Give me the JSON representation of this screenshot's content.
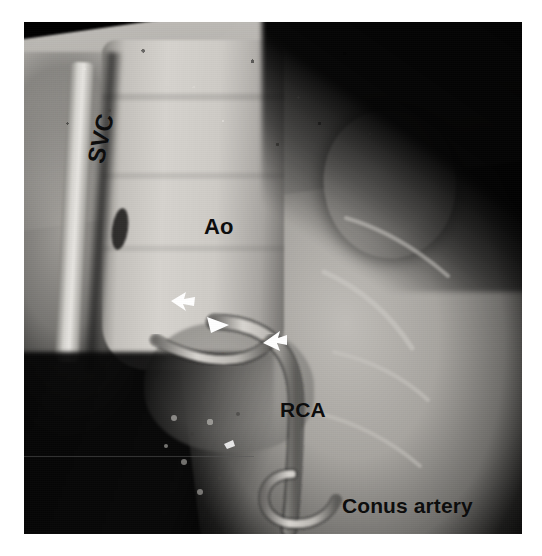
{
  "figure": {
    "modality": "3D volume-rendered CT angiography",
    "frame": {
      "left": 24,
      "top": 22,
      "width": 498,
      "height": 512,
      "background_color": "#000000",
      "border_color": "#111111"
    },
    "page_background": "#ffffff",
    "label_color": "#0b0b0b",
    "marker_color": "#ffffff"
  },
  "labels": [
    {
      "id": "svc",
      "text": "SVC",
      "full_name": "superior vena cava",
      "rotation_deg": -78,
      "x": 58,
      "y": 138,
      "font_size": 24
    },
    {
      "id": "ao",
      "text": "Ao",
      "full_name": "aorta",
      "rotation_deg": 0,
      "x": 180,
      "y": 192,
      "font_size": 22
    },
    {
      "id": "rca",
      "text": "RCA",
      "full_name": "right coronary artery",
      "rotation_deg": 0,
      "x": 256,
      "y": 376,
      "font_size": 21
    },
    {
      "id": "conus",
      "text": "Conus artery",
      "full_name": "conus branch artery",
      "rotation_deg": 0,
      "x": 318,
      "y": 472,
      "font_size": 21
    }
  ],
  "markers": [
    {
      "id": "arrow-1",
      "shape": "solid-arrowhead",
      "color": "#ffffff",
      "x": 146,
      "y": 268,
      "points_direction": "left",
      "annotates": "proximal course marker"
    },
    {
      "id": "arrow-2",
      "shape": "solid-triangle-arrowhead",
      "color": "#ffffff",
      "x": 182,
      "y": 292,
      "points_direction": "up-left",
      "annotates": "mid course marker"
    },
    {
      "id": "arrow-3",
      "shape": "solid-arrowhead",
      "color": "#ffffff",
      "x": 238,
      "y": 308,
      "points_direction": "left",
      "annotates": "distal course marker"
    },
    {
      "id": "arrow-4",
      "shape": "small-speck",
      "color": "#ffffff",
      "x": 200,
      "y": 418,
      "points_direction": "none",
      "annotates": "small calcific speck"
    }
  ],
  "anatomy": {
    "structures": [
      {
        "id": "aorta",
        "label": "Ao",
        "region": "central vertical tube"
      },
      {
        "id": "svc",
        "label": "SVC",
        "region": "left vertical vessel"
      },
      {
        "id": "rca",
        "label": "RCA",
        "region": "descending coronary vessel"
      },
      {
        "id": "conus",
        "label": "Conus artery",
        "region": "inferior curving branch"
      },
      {
        "id": "raa-lobe",
        "label": "",
        "region": "upper-right rounded lobe"
      },
      {
        "id": "aortic-root",
        "label": "",
        "region": "aortic root / sinus bulge"
      }
    ]
  }
}
